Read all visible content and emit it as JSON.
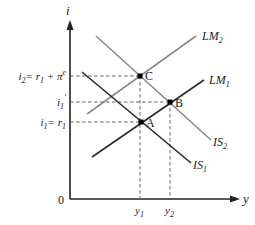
{
  "diagram": {
    "colors": {
      "axis": "#222222",
      "lm1": "#2a2a2a",
      "is1": "#2a2a2a",
      "lm2": "#8a8a8a",
      "is2": "#8a8a8a",
      "guide": "#555555",
      "point": "#000000"
    },
    "axes": {
      "y_label": "i",
      "x_label": "y",
      "origin_label": "0"
    },
    "y_ticks": {
      "i2": {
        "base": "i",
        "sub": "2",
        "rest": "= r",
        "rest_sub": "1",
        "tail": " + π",
        "sup": "e"
      },
      "i1prime": {
        "base": "i",
        "sub": "1",
        "prime": "′"
      },
      "i1": {
        "base": "i",
        "sub": "1",
        "rest": "= r",
        "rest_sub": "1"
      }
    },
    "x_ticks": {
      "y1": {
        "base": "y",
        "sub": "1"
      },
      "y2": {
        "base": "y",
        "sub": "2"
      }
    },
    "curves": {
      "LM1": {
        "base": "LM",
        "sub": "1"
      },
      "LM2": {
        "base": "LM",
        "sub": "2"
      },
      "IS1": {
        "base": "IS",
        "sub": "1"
      },
      "IS2": {
        "base": "IS",
        "sub": "2"
      }
    },
    "points": {
      "A": "A",
      "B": "B",
      "C": "C"
    }
  }
}
